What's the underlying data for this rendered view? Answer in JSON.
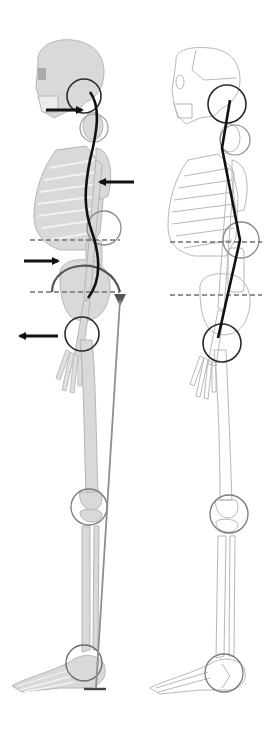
{
  "diagram": {
    "type": "anatomical-posture-comparison",
    "view": "lateral (sagittal) skeleton",
    "panels": [
      {
        "id": "left",
        "state": "faulty posture",
        "skeleton_style": "filled",
        "spine_line": "S-curved (exaggerated)",
        "plumb_line": true,
        "arrows": [
          {
            "location": "neck",
            "direction": "right"
          },
          {
            "location": "thoracic",
            "direction": "left"
          },
          {
            "location": "lumbar",
            "direction": "right"
          },
          {
            "location": "hip",
            "direction": "left"
          }
        ],
        "joint_circles": [
          "head-neck",
          "cervical",
          "lumbar",
          "hip",
          "knee",
          "ankle"
        ],
        "pelvic_rotation_arc": true,
        "reference_lines": [
          "lumbar dashed",
          "pelvis dashed"
        ]
      },
      {
        "id": "right",
        "state": "ideal alignment",
        "skeleton_style": "outline",
        "spine_line": "straight",
        "joint_circles": [
          "head-neck",
          "cervical",
          "lumbar",
          "hip",
          "knee",
          "ankle"
        ],
        "reference_lines": [
          "lumbar dashed",
          "pelvis dashed"
        ]
      }
    ],
    "colors": {
      "bone_fill": "#d9d9d9",
      "bone_stroke": "#b5b5b5",
      "outline_stroke": "#b8b8b8",
      "line_dark": "#111111",
      "circle_dark": "#2a2a2a",
      "circle_grey": "#8a8a8a",
      "dashed": "#707070",
      "plumb": "#8f8f8f"
    }
  }
}
